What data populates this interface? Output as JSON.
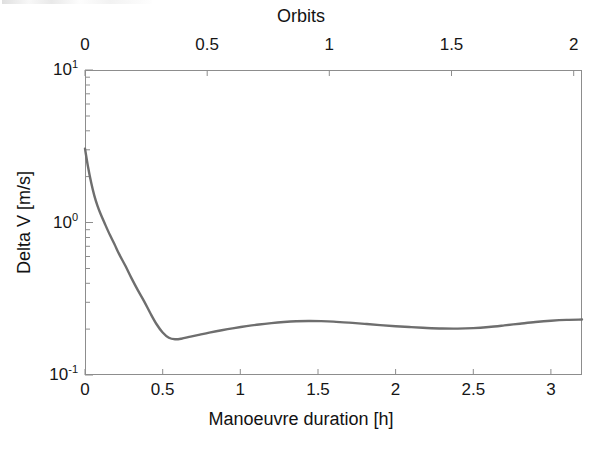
{
  "figure": {
    "background": "#ffffff",
    "axis_color": "#8d8d8d",
    "curve_color": "#6e6e6e",
    "text_color": "#161616"
  },
  "axes": {
    "bottom": {
      "title": "Manoeuvre duration [h]",
      "ticks": [
        "0",
        "0.5",
        "1",
        "1.5",
        "2",
        "2.5",
        "3"
      ],
      "tick_values": [
        0,
        0.5,
        1,
        1.5,
        2,
        2.5,
        3
      ],
      "range": [
        0,
        3.2
      ]
    },
    "top": {
      "title": "Orbits",
      "ticks": [
        "0",
        "0.5",
        "1",
        "1.5",
        "2"
      ],
      "tick_values": [
        0,
        0.5,
        1,
        1.5,
        2
      ],
      "range": [
        0,
        2.0334
      ]
    },
    "left": {
      "title": "Delta V [m/s]",
      "ticks": [
        "10-1",
        "100",
        "101"
      ],
      "tick_exponents": [
        "-1",
        "0",
        "1"
      ],
      "tick_mantissa": "10",
      "scale": "log",
      "range": [
        0.1,
        10
      ]
    }
  },
  "chart_data": {
    "type": "line",
    "title": "",
    "subtitle": "",
    "xlabel": "Manoeuvre duration [h]",
    "ylabel": "Delta V [m/s]",
    "x2label": "Orbits",
    "xlim": [
      0,
      3.2
    ],
    "ylim": [
      0.1,
      10
    ],
    "yscale": "log",
    "x2lim": [
      0,
      2.0334
    ],
    "grid": false,
    "legend": null,
    "series": [
      {
        "name": "Delta V",
        "color": "#6e6e6e",
        "line_width": 2.4,
        "x": [
          0.0,
          0.02,
          0.04,
          0.06,
          0.08,
          0.1,
          0.13,
          0.16,
          0.19,
          0.22,
          0.26,
          0.3,
          0.34,
          0.38,
          0.42,
          0.46,
          0.5,
          0.54,
          0.58,
          0.62,
          0.68,
          0.74,
          0.8,
          0.88,
          0.96,
          1.04,
          1.12,
          1.2,
          1.28,
          1.36,
          1.44,
          1.52,
          1.6,
          1.7,
          1.8,
          1.9,
          2.0,
          2.1,
          2.2,
          2.3,
          2.4,
          2.5,
          2.6,
          2.7,
          2.8,
          2.9,
          3.0,
          3.1,
          3.2
        ],
        "y": [
          3.05,
          2.3,
          1.82,
          1.5,
          1.29,
          1.14,
          0.97,
          0.83,
          0.72,
          0.62,
          0.52,
          0.43,
          0.36,
          0.305,
          0.255,
          0.216,
          0.19,
          0.1755,
          0.1715,
          0.173,
          0.1785,
          0.184,
          0.1895,
          0.1965,
          0.203,
          0.209,
          0.2145,
          0.219,
          0.2225,
          0.225,
          0.226,
          0.2255,
          0.224,
          0.2205,
          0.2165,
          0.2125,
          0.209,
          0.206,
          0.2035,
          0.2018,
          0.2015,
          0.203,
          0.2065,
          0.2115,
          0.217,
          0.2225,
          0.227,
          0.23,
          0.231
        ],
        "annotations": [
          {
            "label": "minimum",
            "x": 0.58,
            "y": 0.1715
          },
          {
            "label": "first local maximum",
            "x": 1.44,
            "y": 0.226
          },
          {
            "label": "second local minimum",
            "x": 2.4,
            "y": 0.2015
          },
          {
            "label": "end value",
            "x": 3.2,
            "y": 0.231
          }
        ]
      }
    ]
  }
}
